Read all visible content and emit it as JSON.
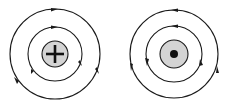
{
  "diagrams": [
    {
      "id": "positive-charge",
      "center_symbol": "plus",
      "field_direction": "clockwise",
      "center": [
        55,
        54
      ],
      "radii": {
        "outer": 45,
        "inner": 27,
        "core": 13
      }
    },
    {
      "id": "dot-charge",
      "center_symbol": "dot",
      "field_direction": "counterclockwise",
      "center": [
        174,
        54
      ],
      "radii": {
        "outer": 44,
        "inner": 28,
        "core": 14
      }
    }
  ],
  "colors": {
    "line": "#1a1a1a",
    "core_fill": "#d4d4d4",
    "background": "#ffffff"
  }
}
